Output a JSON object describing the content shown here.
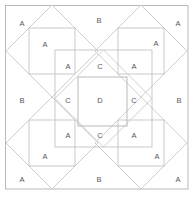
{
  "diagram": {
    "type": "symmetric-square-pattern",
    "canvas": {
      "width": 194,
      "height": 197
    },
    "colors": {
      "background": "#ffffff",
      "stroke_outer": "#b9b9bb",
      "stroke_inner": "#c3c3c5",
      "stroke_diagonal": "#c9c9cb",
      "label_text": "#58585a"
    },
    "geometry": {
      "outer_border": {
        "x": 5.5,
        "y": 5.5,
        "width": 182.5,
        "height": 183.5
      },
      "middle_frame": {
        "x": 55,
        "y": 50,
        "width": 97,
        "height": 97
      },
      "center_square": {
        "x": 78,
        "y": 77,
        "width": 49,
        "height": 49
      },
      "quadrant_diamond_radius": 46,
      "quadrant_centers": [
        {
          "x": 52,
          "y": 51
        },
        {
          "x": 141,
          "y": 51
        },
        {
          "x": 52,
          "y": 143
        },
        {
          "x": 141,
          "y": 143
        }
      ]
    },
    "labels": [
      {
        "id": "label-a-tl-outer",
        "text": "A",
        "x": 22,
        "y": 24
      },
      {
        "id": "label-b-top",
        "text": "B",
        "x": 99,
        "y": 21
      },
      {
        "id": "label-a-tr-outer",
        "text": "A",
        "x": 178,
        "y": 24
      },
      {
        "id": "label-a-tl-inner",
        "text": "A",
        "x": 45,
        "y": 45
      },
      {
        "id": "label-a-tr-inner",
        "text": "A",
        "x": 156,
        "y": 44
      },
      {
        "id": "label-a-mid-tl",
        "text": "A",
        "x": 68,
        "y": 67
      },
      {
        "id": "label-c-top",
        "text": "C",
        "x": 100,
        "y": 67
      },
      {
        "id": "label-a-mid-tr",
        "text": "A",
        "x": 134,
        "y": 67
      },
      {
        "id": "label-b-left",
        "text": "B",
        "x": 22,
        "y": 101
      },
      {
        "id": "label-c-left",
        "text": "C",
        "x": 68,
        "y": 101
      },
      {
        "id": "label-d-center",
        "text": "D",
        "x": 100,
        "y": 101
      },
      {
        "id": "label-c-right",
        "text": "C",
        "x": 134,
        "y": 101
      },
      {
        "id": "label-b-right",
        "text": "B",
        "x": 179,
        "y": 101
      },
      {
        "id": "label-a-mid-bl",
        "text": "A",
        "x": 68,
        "y": 136
      },
      {
        "id": "label-c-bottom",
        "text": "C",
        "x": 100,
        "y": 136
      },
      {
        "id": "label-a-mid-br",
        "text": "A",
        "x": 134,
        "y": 136
      },
      {
        "id": "label-a-bl-inner",
        "text": "A",
        "x": 45,
        "y": 157
      },
      {
        "id": "label-a-br-inner",
        "text": "A",
        "x": 157,
        "y": 157
      },
      {
        "id": "label-a-bl-outer",
        "text": "A",
        "x": 22,
        "y": 180
      },
      {
        "id": "label-b-bottom",
        "text": "B",
        "x": 99,
        "y": 180
      },
      {
        "id": "label-a-br-outer",
        "text": "A",
        "x": 178,
        "y": 180
      }
    ],
    "label_legend": {
      "A": "A",
      "B": "B",
      "C": "C",
      "D": "D"
    }
  }
}
